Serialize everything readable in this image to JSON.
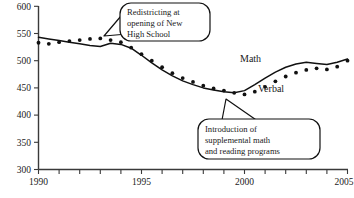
{
  "chart_data": {
    "type": "line",
    "title": "",
    "subtitle": "",
    "xlabel": "",
    "ylabel": "",
    "xlim": [
      1990,
      2005
    ],
    "ylim": [
      300,
      600
    ],
    "grid": false,
    "legend_position": "inline-labels",
    "x_ticks": [
      1990,
      1991,
      1992,
      1993,
      1994,
      1995,
      1996,
      1997,
      1998,
      1999,
      2000,
      2001,
      2002,
      2003,
      2004,
      2005
    ],
    "x_tick_labels": [
      "1990",
      "",
      "",
      "",
      "",
      "1995",
      "",
      "",
      "",
      "",
      "2000",
      "",
      "",
      "",
      "",
      "2005"
    ],
    "y_ticks": [
      300,
      350,
      400,
      450,
      500,
      550,
      600
    ],
    "y_tick_labels": [
      "300",
      "350",
      "400",
      "450",
      "500",
      "550",
      "600"
    ],
    "x": [
      1990,
      1990.5,
      1991,
      1991.5,
      1992,
      1992.5,
      1993,
      1993.5,
      1994,
      1994.5,
      1995,
      1995.5,
      1996,
      1996.5,
      1997,
      1997.5,
      1998,
      1998.5,
      1999,
      1999.5,
      2000,
      2000.5,
      2001,
      2001.5,
      2002,
      2002.5,
      2003,
      2003.5,
      2004,
      2004.5,
      2005
    ],
    "series": [
      {
        "name": "Math",
        "style": "solid",
        "values": [
          543,
          540,
          537,
          534,
          531,
          528,
          526,
          532,
          530,
          523,
          510,
          496,
          483,
          472,
          463,
          456,
          450,
          446,
          443,
          441,
          445,
          456,
          468,
          479,
          488,
          494,
          497,
          495,
          493,
          497,
          503
        ]
      },
      {
        "name": "Verbal",
        "style": "dotted",
        "values": [
          533,
          531,
          534,
          536,
          538,
          540,
          541,
          538,
          534,
          524,
          512,
          500,
          488,
          477,
          468,
          461,
          454,
          449,
          445,
          441,
          438,
          443,
          452,
          462,
          471,
          478,
          483,
          486,
          484,
          489,
          500
        ]
      }
    ],
    "series_labels": [
      {
        "name": "Math",
        "text": "Math"
      },
      {
        "name": "Verbal",
        "text": "Verbal"
      }
    ],
    "annotations": [
      {
        "id": "redistricting",
        "lines": [
          "Redistricting at",
          "opening of New",
          "High School"
        ],
        "points_to_year": 1993
      },
      {
        "id": "supplemental-programs",
        "lines": [
          "Introduction of",
          "supplemental math",
          "and reading programs"
        ],
        "points_to_year": 1999.5
      }
    ]
  },
  "labels": {
    "math": "Math",
    "verbal": "Verbal"
  },
  "callout_one": {
    "line1": "Redistricting at",
    "line2": "opening of New",
    "line3": "High School"
  },
  "callout_two": {
    "line1": "Introduction of",
    "line2": "supplemental math",
    "line3": "and reading programs"
  },
  "axis": {
    "y": {
      "t0": "300",
      "t1": "350",
      "t2": "400",
      "t3": "450",
      "t4": "500",
      "t5": "550",
      "t6": "600"
    },
    "x": {
      "t0": "1990",
      "t1": "1995",
      "t2": "2000",
      "t3": "2005"
    }
  },
  "colors": {
    "ink": "#111111",
    "axis": "#3a3a3a",
    "background": "#ffffff"
  }
}
